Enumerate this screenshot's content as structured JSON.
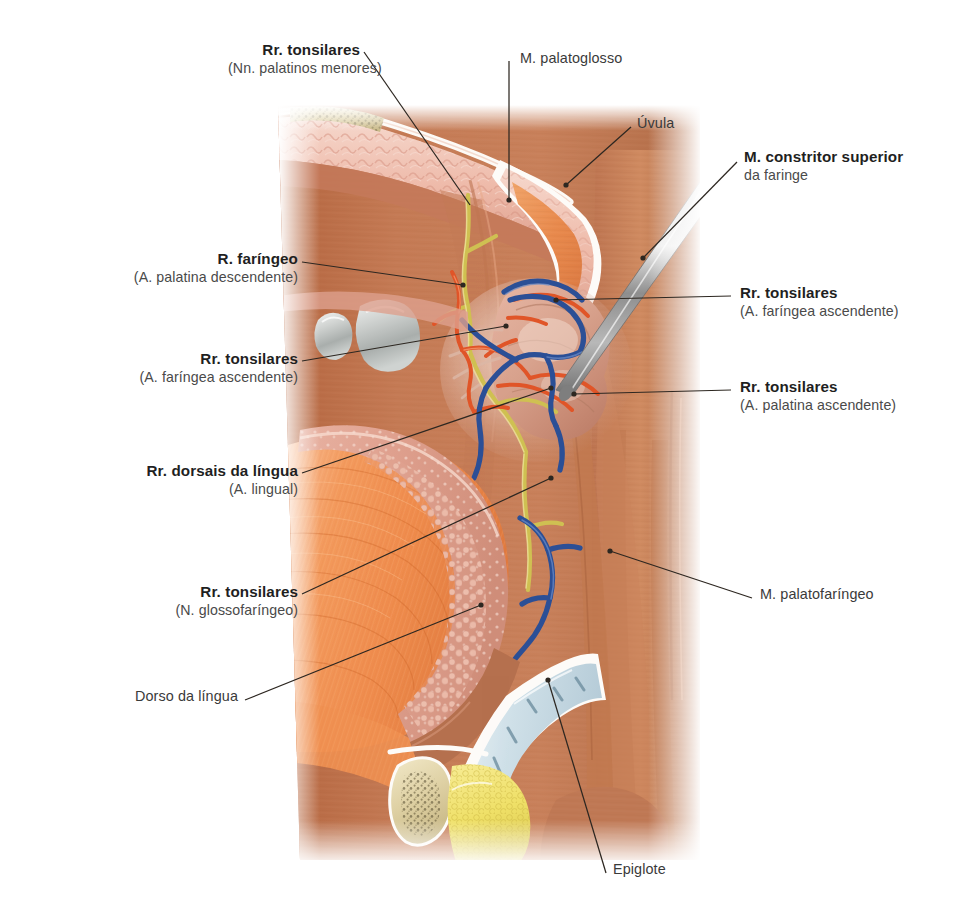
{
  "figure": {
    "type": "anatomical-illustration",
    "view": "corte sagital da cavidade oral e faringe",
    "language": "pt-BR"
  },
  "labels": [
    {
      "id": "rr-tonsilares-nn-palatinos-menores",
      "name": "rr-tonsilares-nervos-palatinos-menores",
      "main": "Rr. tonsilares",
      "sub": "(Nn. palatinos menores)",
      "align": "right",
      "x": 228,
      "y": 41,
      "width": 132,
      "leader": [
        [
          364,
          52
        ],
        [
          470,
          205
        ]
      ],
      "dot": false
    },
    {
      "id": "m-palatoglosso",
      "name": "musculo-palatoglosso",
      "main": "M. palatoglosso",
      "sub": "",
      "align": "left",
      "x": 520,
      "y": 50,
      "width": 120,
      "leader": [
        [
          509,
          61
        ],
        [
          509,
          200
        ]
      ],
      "dot": true
    },
    {
      "id": "uvula",
      "name": "uvula",
      "main": "Úvula",
      "sub": "",
      "align": "left",
      "x": 637,
      "y": 115,
      "width": 50,
      "leader": [
        [
          631,
          127
        ],
        [
          566,
          185
        ]
      ],
      "dot": true
    },
    {
      "id": "m-constritor-superior-da-faringe",
      "name": "musculo-constritor-superior-da-faringe",
      "main": "M. constritor superior",
      "sub": "da faringe",
      "align": "left",
      "x": 744,
      "y": 148,
      "width": 170,
      "leader": [
        [
          737,
          162
        ],
        [
          643,
          258
        ]
      ],
      "dot": true
    },
    {
      "id": "r-faringeo-a-palatina-descendente",
      "name": "ramo-faringeo-arteria-palatina-descendente",
      "main": "R. faríngeo",
      "sub": "(A. palatina descendente)",
      "align": "right",
      "x": 128,
      "y": 250,
      "width": 170,
      "leader": [
        [
          302,
          262
        ],
        [
          463,
          285
        ]
      ],
      "dot": true
    },
    {
      "id": "rr-tonsilares-a-faringea-ascendente-dir",
      "name": "rr-tonsilares-arteria-faringea-ascendente-direita",
      "main": "Rr. tonsilares",
      "sub": "(A. faríngea ascendente)",
      "align": "left",
      "x": 740,
      "y": 284,
      "width": 180,
      "leader": [
        [
          731,
          296
        ],
        [
          556,
          300
        ]
      ],
      "dot": true
    },
    {
      "id": "rr-tonsilares-a-faringea-ascendente-esq",
      "name": "rr-tonsilares-arteria-faringea-ascendente-esquerda",
      "main": "Rr. tonsilares",
      "sub": "(A. faríngea ascendente)",
      "align": "right",
      "x": 80,
      "y": 350,
      "width": 218,
      "leader": [
        [
          302,
          361
        ],
        [
          506,
          326
        ]
      ],
      "dot": true
    },
    {
      "id": "rr-tonsilares-a-palatina-ascendente",
      "name": "rr-tonsilares-arteria-palatina-ascendente",
      "main": "Rr. tonsilares",
      "sub": "(A. palatina ascendente)",
      "align": "left",
      "x": 740,
      "y": 378,
      "width": 180,
      "leader": [
        [
          731,
          390
        ],
        [
          574,
          394
        ]
      ],
      "dot": true
    },
    {
      "id": "rr-dorsais-da-lingua",
      "name": "rr-dorsais-da-lingua-arteria-lingual",
      "main": "Rr. dorsais da língua",
      "sub": "(A. lingual)",
      "align": "right",
      "x": 56,
      "y": 462,
      "width": 242,
      "leader": [
        [
          302,
          473
        ],
        [
          551,
          388
        ]
      ],
      "dot": true
    },
    {
      "id": "rr-tonsilares-n-glossofaringeo",
      "name": "rr-tonsilares-nervo-glossofaringeo",
      "main": "Rr. tonsilares",
      "sub": "(N. glossofaríngeo)",
      "align": "right",
      "x": 110,
      "y": 583,
      "width": 188,
      "leader": [
        [
          302,
          594
        ],
        [
          551,
          478
        ]
      ],
      "dot": true
    },
    {
      "id": "m-palatofaringeo",
      "name": "musculo-palatofaringeo",
      "main": "M. palatofaríngeo",
      "sub": "",
      "align": "left",
      "x": 760,
      "y": 586,
      "width": 140,
      "leader": [
        [
          752,
          598
        ],
        [
          610,
          551
        ]
      ],
      "dot": true
    },
    {
      "id": "dorso-da-lingua",
      "name": "dorso-da-lingua",
      "main": "Dorso da língua",
      "sub": "",
      "align": "right",
      "x": 110,
      "y": 688,
      "width": 128,
      "leader": [
        [
          245,
          700
        ],
        [
          481,
          605
        ]
      ],
      "dot": true
    },
    {
      "id": "epiglote",
      "name": "epiglote",
      "main": "Epiglote",
      "sub": "",
      "align": "left",
      "x": 613,
      "y": 861,
      "width": 70,
      "leader": [
        [
          606,
          873
        ],
        [
          548,
          680
        ]
      ],
      "dot": true
    }
  ],
  "structures": {
    "hard_palate": "Palato duro",
    "palatal_rugae": "Rugas palatinas",
    "soft_palate": "Palato mole",
    "uvula": "Úvula",
    "palatine_tonsil": "Tonsila palatina",
    "tongue": "Língua",
    "lingual_tonsil": "Tonsila lingual",
    "epiglottis": "Epiglote",
    "hyoid_bone": "Osso hioide",
    "molars": "Molares",
    "probe": "Sonda metálica",
    "pharyngeal_wall": "Parede faríngea"
  },
  "palette": {
    "background": "#ffffff",
    "leader_line": "#2d2721",
    "label_main": "#1f1f1f",
    "label_sub": "#4a4a4a",
    "mucosa_pink": "#e9b4a6",
    "mucosa_pink_light": "#f2cdc1",
    "palate_rugae": "#eeb9ab",
    "muscle_orange": "#e98a52",
    "muscle_orange_bright": "#f29355",
    "pharynx_brown": "#c1734f",
    "pharynx_brown_dark": "#a85f3f",
    "tonsil_pale": "#d8a08c",
    "artery_red": "#e2552a",
    "vein_blue": "#2b4f96",
    "nerve_yellow": "#d4c64f",
    "cartilage_blue": "#c9dce4",
    "bone_cream": "#ded0a3",
    "fat_yellow": "#f0e06a",
    "tooth_grey": "#bfc2c0",
    "metal_grey": "#9a9a9a",
    "white_fascia": "#fdfbf8"
  }
}
